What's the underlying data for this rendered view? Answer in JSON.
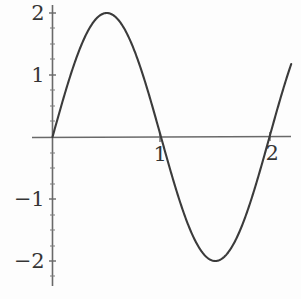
{
  "figure": {
    "background_color": "#fefefe",
    "curve_color": "#262626",
    "axis_color": "#5a5a5a",
    "label_color": "#1f1f1f"
  },
  "axes": {
    "x_axis_name": "x-axis",
    "y_axis_name": "y-axis",
    "x_tick_labels": [
      "1",
      "2"
    ],
    "y_tick_labels": [
      "2",
      "1",
      "−1",
      "−2"
    ]
  },
  "chart_data": {
    "type": "line",
    "title": "",
    "subtitle": "",
    "xlabel": "",
    "ylabel": "",
    "xlim": [
      -0.2,
      2.22
    ],
    "ylim": [
      -2.15,
      2.15
    ],
    "grid": false,
    "legend": null,
    "xticks": [
      1,
      2
    ],
    "xticklabels": [
      "1",
      "2"
    ],
    "yticks": [
      2,
      1,
      -1,
      -2
    ],
    "yticklabels": [
      "2",
      "1",
      "−1",
      "−2"
    ],
    "series": [
      {
        "name": "y = 2 sin(pi x)",
        "expression": "2*sin(pi*x)",
        "amplitude": 2,
        "period": 2,
        "x": [
          0,
          0.1,
          0.2,
          0.3,
          0.4,
          0.5,
          0.6,
          0.7,
          0.8,
          0.9,
          1.0,
          1.1,
          1.2,
          1.3,
          1.4,
          1.5,
          1.6,
          1.7,
          1.8,
          1.9,
          2.0,
          2.1,
          2.2
        ],
        "values": [
          0,
          0.618,
          1.176,
          1.618,
          1.902,
          2.0,
          1.902,
          1.618,
          1.176,
          0.618,
          0,
          -0.618,
          -1.176,
          -1.618,
          -1.902,
          -2.0,
          -1.902,
          -1.618,
          -1.176,
          -0.618,
          0,
          0.618,
          1.176
        ]
      }
    ],
    "annotations": [
      {
        "label": "maximum",
        "x": 0.5,
        "y": 2
      },
      {
        "label": "minimum",
        "x": 1.5,
        "y": -2
      },
      {
        "label": "zero-crossing",
        "x": 0,
        "y": 0
      },
      {
        "label": "zero-crossing",
        "x": 1,
        "y": 0
      },
      {
        "label": "zero-crossing",
        "x": 2,
        "y": 0
      }
    ]
  }
}
